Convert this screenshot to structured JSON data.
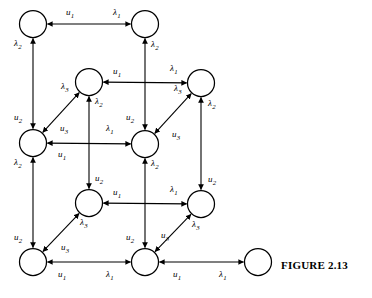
{
  "figure": {
    "caption": "FIGURE 2.13",
    "caption_x": 281,
    "caption_y": 259
  },
  "style": {
    "stroke": "#000000",
    "fill": "#ffffff",
    "node_radius": 13.5,
    "line_width": 1.1,
    "label_font_size": 9
  },
  "labels": {
    "u1": "u",
    "u2": "u",
    "u3": "u",
    "lambda1": "λ",
    "lambda2": "λ",
    "lambda3": "λ",
    "sub1": "1",
    "sub2": "2",
    "sub3": "3"
  },
  "nodes": [
    {
      "id": "n-top-left",
      "cx": 33,
      "cy": 24
    },
    {
      "id": "n-top-right",
      "cx": 145,
      "cy": 24
    },
    {
      "id": "n-mid-upper-left",
      "cx": 89,
      "cy": 82
    },
    {
      "id": "n-mid-upper-right",
      "cx": 201,
      "cy": 83
    },
    {
      "id": "n-mid-left",
      "cx": 33,
      "cy": 143
    },
    {
      "id": "n-center",
      "cx": 145,
      "cy": 144
    },
    {
      "id": "n-mid-lower-left",
      "cx": 89,
      "cy": 203
    },
    {
      "id": "n-mid-lower-right",
      "cx": 201,
      "cy": 204
    },
    {
      "id": "n-bottom-left",
      "cx": 33,
      "cy": 262
    },
    {
      "id": "n-bottom-center",
      "cx": 145,
      "cy": 262
    },
    {
      "id": "n-bottom-right-isolated",
      "cx": 258,
      "cy": 262
    }
  ],
  "edges": [
    {
      "id": "e-h-top",
      "kind": "horizontal",
      "from": "n-top-left",
      "to": "n-top-right",
      "label_back": "u1",
      "label_fwd": "lambda1",
      "lbx": 66,
      "lby": 15,
      "lfx": 113,
      "lfy": 15
    },
    {
      "id": "e-h-midupper",
      "kind": "horizontal",
      "from": "n-mid-upper-left",
      "to": "n-mid-upper-right",
      "label_back": "u1",
      "label_fwd": "lambda1",
      "lbx": 113,
      "lby": 74,
      "lfx": 170,
      "lfy": 71
    },
    {
      "id": "e-h-midleft-center",
      "kind": "horizontal",
      "from": "n-mid-left",
      "to": "n-center",
      "label_back": "u1",
      "label_fwd": "lambda1",
      "lbx": 58,
      "lby": 157,
      "lfx": 106,
      "lfy": 131
    },
    {
      "id": "e-h-midlower",
      "kind": "horizontal",
      "from": "n-mid-lower-left",
      "to": "n-mid-lower-right",
      "label_back": "u1",
      "label_fwd": "lambda1",
      "lbx": 113,
      "lby": 195,
      "lfx": 170,
      "lfy": 192
    },
    {
      "id": "e-h-bottom-left",
      "kind": "horizontal",
      "from": "n-bottom-left",
      "to": "n-bottom-center",
      "label_back": "u1",
      "label_fwd": "lambda1",
      "lbx": 58,
      "lby": 277,
      "lfx": 106,
      "lfy": 277
    },
    {
      "id": "e-h-bottom-right",
      "kind": "horizontal",
      "from": "n-bottom-center",
      "to": "n-bottom-right-isolated",
      "label_back": "u1",
      "label_fwd": "lambda1",
      "lbx": 173,
      "lby": 277,
      "lfx": 219,
      "lfy": 277
    },
    {
      "id": "e-v-left-upper",
      "kind": "vertical",
      "from": "n-mid-left",
      "to": "n-top-left",
      "label_up": "lambda2",
      "label_dn": "u2",
      "lux": 14,
      "luy": 46,
      "ldx": 14,
      "ldy": 120
    },
    {
      "id": "e-v-left-lower",
      "kind": "vertical",
      "from": "n-bottom-left",
      "to": "n-mid-left",
      "label_up": "lambda2",
      "label_dn": "u2",
      "lux": 14,
      "luy": 165,
      "ldx": 14,
      "ldy": 240
    },
    {
      "id": "e-v-inner-upper",
      "kind": "vertical",
      "from": "n-center",
      "to": "n-top-right",
      "label_up": "lambda2",
      "label_dn": "u2",
      "lux": 151,
      "luy": 47,
      "ldx": 126,
      "ldy": 120
    },
    {
      "id": "e-v-inner-lower",
      "kind": "vertical",
      "from": "n-bottom-center",
      "to": "n-center",
      "label_up": "lambda2",
      "label_dn": "u2",
      "lux": 151,
      "luy": 166,
      "ldx": 126,
      "ldy": 240
    },
    {
      "id": "e-v-mid-upper",
      "kind": "vertical",
      "from": "n-mid-lower-left",
      "to": "n-mid-upper-left",
      "label_up": "lambda2",
      "label_dn": "u2",
      "lux": 95,
      "luy": 104,
      "ldx": 95,
      "ldy": 181
    },
    {
      "id": "e-v-right-upper",
      "kind": "vertical",
      "from": "n-mid-lower-right",
      "to": "n-mid-upper-right",
      "label_up": "lambda2",
      "label_dn": "u2",
      "lux": 208,
      "luy": 106,
      "ldx": 208,
      "ldy": 182
    },
    {
      "id": "e-d-upper-left",
      "kind": "diagonal",
      "from": "n-mid-left",
      "to": "n-mid-upper-left",
      "label_up": "lambda3",
      "label_dn": "u3",
      "lux": 61,
      "luy": 89,
      "ldx": 60,
      "ldy": 131
    },
    {
      "id": "e-d-upper-right",
      "kind": "diagonal",
      "from": "n-center",
      "to": "n-mid-upper-right",
      "label_up": "lambda3",
      "label_dn": "u3",
      "lux": 174,
      "luy": 91,
      "ldx": 172,
      "ldy": 137
    },
    {
      "id": "e-d-lower-left",
      "kind": "diagonal",
      "from": "n-bottom-left",
      "to": "n-mid-lower-left",
      "label_up": "lambda3",
      "label_dn": "u3",
      "lux": 80,
      "luy": 225,
      "ldx": 61,
      "ldy": 250
    },
    {
      "id": "e-d-lower-right",
      "kind": "diagonal",
      "from": "n-bottom-center",
      "to": "n-mid-lower-right",
      "label_up": "lambda3",
      "label_dn": "u3",
      "lux": 192,
      "luy": 227,
      "ldx": 161,
      "ldy": 238
    }
  ]
}
